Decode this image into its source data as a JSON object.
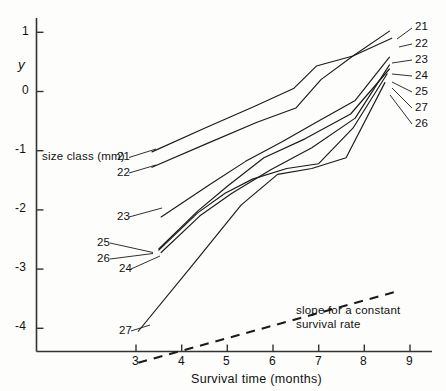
{
  "chart_data": {
    "type": "line",
    "title": "",
    "xlabel": "Survival time (months)",
    "ylabel": "y",
    "xlim": [
      2.55,
      9.45
    ],
    "ylim": [
      -4.62,
      1.42
    ],
    "xticks": [
      3,
      4,
      5,
      6,
      7,
      8,
      9
    ],
    "xticklabels": [
      "3",
      "4",
      "5",
      "6",
      "7",
      "8",
      "9"
    ],
    "yticks": [
      1,
      0,
      -1,
      -2,
      -3,
      -4
    ],
    "yticklabels": [
      "1",
      "0",
      "-1",
      "-2",
      "-3",
      "-4"
    ],
    "grid": false,
    "legend_position": "inline-end-labels",
    "series_group_label": "size class (mm)",
    "series": [
      {
        "name": "21",
        "label_left": "21",
        "label_right": "21",
        "x": [
          3.35,
          4.5,
          5.6,
          6.45,
          6.95,
          7.75,
          8.55
        ],
        "values": [
          -1.02,
          -0.62,
          -0.25,
          0.05,
          0.43,
          0.6,
          1.02
        ]
      },
      {
        "name": "22",
        "label_left": "22",
        "label_right": "22",
        "x": [
          3.35,
          4.55,
          5.65,
          6.5,
          7.05,
          7.75,
          8.6
        ],
        "values": [
          -1.28,
          -0.88,
          -0.52,
          -0.28,
          0.2,
          0.6,
          0.9
        ]
      },
      {
        "name": "23",
        "label_left": "23",
        "label_right": "23",
        "x": [
          3.55,
          4.6,
          5.4,
          6.2,
          6.95,
          7.8,
          8.55
        ],
        "values": [
          -2.12,
          -1.58,
          -1.18,
          -0.85,
          -0.52,
          -0.15,
          0.58
        ]
      },
      {
        "name": "24",
        "label_left": "24",
        "label_right": "24",
        "x": [
          3.55,
          4.4,
          5.1,
          5.95,
          6.85,
          7.8,
          8.55
        ],
        "values": [
          -2.72,
          -2.1,
          -1.72,
          -1.32,
          -0.95,
          -0.45,
          0.45
        ]
      },
      {
        "name": "25",
        "label_left": "25",
        "label_right": "25",
        "x": [
          3.5,
          4.35,
          5.0,
          5.8,
          6.7,
          7.7,
          8.55
        ],
        "values": [
          -2.66,
          -2.02,
          -1.6,
          -1.12,
          -0.8,
          -0.38,
          0.38
        ]
      },
      {
        "name": "26",
        "label_left": "26",
        "label_right": "26",
        "x": [
          3.5,
          4.35,
          4.95,
          5.55,
          6.3,
          7.0,
          7.75,
          8.5
        ],
        "values": [
          -2.68,
          -2.05,
          -1.72,
          -1.48,
          -1.3,
          -1.22,
          -0.62,
          0.3
        ]
      },
      {
        "name": "27",
        "label_left": "27",
        "label_right": "27",
        "x": [
          3.05,
          4.25,
          5.3,
          6.1,
          6.85,
          7.6,
          8.45
        ],
        "values": [
          -4.05,
          -2.92,
          -1.92,
          -1.4,
          -1.3,
          -1.12,
          0.15
        ]
      }
    ],
    "reference_line": {
      "label": "slope for a constant\nsurvival rate",
      "label_line1": "slope for a constant",
      "label_line2": "survival rate",
      "style": "dashed",
      "x": [
        3.05,
        8.7
      ],
      "values": [
        -4.58,
        -3.38
      ]
    },
    "annotations": [
      {
        "text": "size class (mm)",
        "position": "left-of-series-labels"
      }
    ]
  },
  "axes": {
    "y_axis_label": "y",
    "x_axis_label": "Survival time (months)"
  },
  "left_labels": [
    {
      "text": "21"
    },
    {
      "text": "22"
    },
    {
      "text": "23"
    },
    {
      "text": "25"
    },
    {
      "text": "26"
    },
    {
      "text": "24"
    },
    {
      "text": "27"
    }
  ],
  "right_labels": [
    {
      "text": "21"
    },
    {
      "text": "22"
    },
    {
      "text": "23"
    },
    {
      "text": "24"
    },
    {
      "text": "25"
    },
    {
      "text": "27"
    },
    {
      "text": "26"
    }
  ],
  "note": {
    "line1": "slope for a constant",
    "line2": "survival rate"
  },
  "size_class_caption": "size class (mm)",
  "colors": {
    "ink": "#1a1a1a",
    "axis": "#333333",
    "background": "#fdfdfb"
  }
}
